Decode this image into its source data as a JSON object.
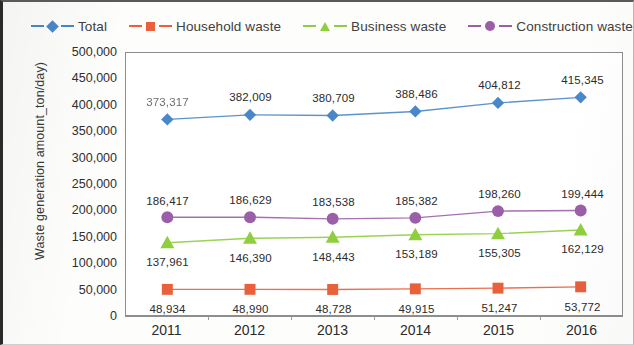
{
  "legend": {
    "items": [
      {
        "label": "Total",
        "marker": "diamond-marker-icon",
        "color": "#4a87c9"
      },
      {
        "label": "Household waste",
        "marker": "square-marker-icon",
        "color": "#e8603c"
      },
      {
        "label": "Business waste",
        "marker": "triangle-marker-icon",
        "color": "#8fce3f"
      },
      {
        "label": "Construction waste",
        "marker": "circle-marker-icon",
        "color": "#9b5fa8"
      }
    ]
  },
  "axes": {
    "y_title": "Waste generation amount_ton/day)",
    "y_ticks": [
      "500,000",
      "450,000",
      "400,000",
      "350,000",
      "300,000",
      "250,000",
      "200,000",
      "150,000",
      "100,000",
      "50,000",
      "0"
    ],
    "x_ticks": [
      "2011",
      "2012",
      "2013",
      "2014",
      "2015",
      "2016"
    ]
  },
  "chart_data": {
    "type": "line",
    "title": "",
    "xlabel": "",
    "ylabel": "Waste generation amount_ton/day)",
    "categories": [
      "2011",
      "2012",
      "2013",
      "2014",
      "2015",
      "2016"
    ],
    "ylim": [
      0,
      500000
    ],
    "ytick_step": 50000,
    "grid": false,
    "legend_position": "top",
    "series": [
      {
        "name": "Total",
        "color": "#4a87c9",
        "marker": "diamond",
        "label_position": "above",
        "values": [
          373317,
          382009,
          380709,
          388486,
          404812,
          415345
        ],
        "labels": [
          "373,317",
          "382,009",
          "380,709",
          "388,486",
          "404,812",
          "415,345"
        ]
      },
      {
        "name": "Construction waste",
        "color": "#9b5fa8",
        "marker": "circle",
        "label_position": "above",
        "values": [
          186417,
          186629,
          183538,
          185382,
          198260,
          199444
        ],
        "labels": [
          "186,417",
          "186,629",
          "183,538",
          "185,382",
          "198,260",
          "199,444"
        ]
      },
      {
        "name": "Business waste",
        "color": "#8fce3f",
        "marker": "triangle",
        "label_position": "below",
        "values": [
          137961,
          146390,
          148443,
          153189,
          155305,
          162129
        ],
        "labels": [
          "137,961",
          "146,390",
          "148,443",
          "153,189",
          "155,305",
          "162,129"
        ]
      },
      {
        "name": "Household waste",
        "color": "#e8603c",
        "marker": "square",
        "label_position": "below",
        "values": [
          48934,
          48990,
          48728,
          49915,
          51247,
          53772
        ],
        "labels": [
          "48,934",
          "48,990",
          "48,728",
          "49,915",
          "51,247",
          "53,772"
        ]
      }
    ]
  }
}
